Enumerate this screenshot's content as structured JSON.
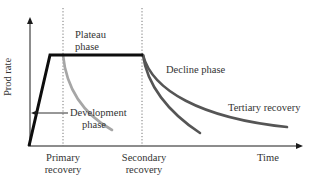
{
  "diagram": {
    "type": "production-profile",
    "axes": {
      "y_label": "Prod rate",
      "x_label": "Time"
    },
    "labels": {
      "plateau_line1": "Plateau",
      "plateau_line2": "phase",
      "decline": "Decline phase",
      "tertiary": "Tertiary recovery",
      "development_line1": "Development",
      "development_line2": "phase",
      "primary_line1": "Primary",
      "primary_line2": "recovery",
      "secondary_line1": "Secondary",
      "secondary_line2": "recovery"
    },
    "colors": {
      "axis": "#1a1a1a",
      "main_curve": "#0d0d0d",
      "primary_decline": "#a6a6a6",
      "secondary_decline": "#555555",
      "tertiary_decline": "#555555",
      "dotted_divider": "#666666",
      "text": "#333333"
    },
    "curves": [
      {
        "name": "production-buildup-plateau",
        "points": [
          [
            29,
            146
          ],
          [
            50,
            55
          ],
          [
            143,
            55
          ]
        ]
      },
      {
        "name": "primary-recovery-decline",
        "start": [
          63,
          55
        ],
        "end": [
          112,
          130
        ]
      },
      {
        "name": "secondary-recovery-decline",
        "start": [
          143,
          55
        ],
        "end": [
          200,
          133
        ]
      },
      {
        "name": "tertiary-recovery-decline",
        "start": [
          143,
          55
        ],
        "end": [
          287,
          127
        ]
      }
    ]
  }
}
